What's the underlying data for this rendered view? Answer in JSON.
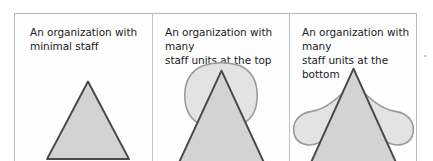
{
  "figure": {
    "type": "diagram",
    "panel_count": 3,
    "colors": {
      "triangle_fill": "#d3d3d3",
      "triangle_stroke": "#4a4a4a",
      "blob_fill": "#e3e3e3",
      "blob_stroke": "#9a9a9a",
      "frame_border": "#b9b9b9",
      "divider": "#c2c2c2",
      "text": "#1b1b1b",
      "background": "#ffffff"
    }
  },
  "panels": [
    {
      "id": "minimal-staff",
      "caption_line1": "An organization with",
      "caption_line2": "minimal staff",
      "shapes": [
        "triangle"
      ],
      "blob": null
    },
    {
      "id": "staff-at-top",
      "caption_line1": "An organization with many",
      "caption_line2": "staff units at the top",
      "shapes": [
        "triangle",
        "rounded-blob-top"
      ],
      "blob": "rounded square bulge centered on the upper portion of the triangle"
    },
    {
      "id": "staff-at-bottom",
      "caption_line1": "An organization with many",
      "caption_line2": "staff units at the bottom",
      "shapes": [
        "triangle",
        "wide-blob-bottom"
      ],
      "blob": "wide flattened lobes spreading outward near the base of the triangle"
    }
  ],
  "artifact": {
    "name": "scan-speck",
    "visible": true
  }
}
